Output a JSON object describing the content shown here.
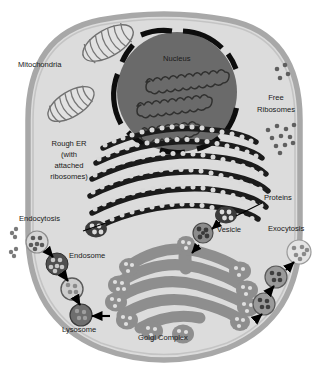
{
  "diagram": {
    "type": "biology-cell-diagram",
    "background_color": "#ffffff",
    "colors": {
      "cell_membrane": "#a8a8a8",
      "cytoplasm": "#dcdcdc",
      "nucleus_fill": "#6a6a6a",
      "nuclear_envelope": "#101010",
      "chromatin": "#3a3a3a",
      "rough_er_membrane": "#1c1c1c",
      "ribosome_dot": "#d8d8d8",
      "golgi_fill": "#8e8e8e",
      "mitochondria_fill": "#e0e0e0",
      "mitochondria_outline": "#6f6f6f",
      "vesicle_fill": "#9a9a9a",
      "lysosome_fill": "#707070",
      "endosome_fill": "#5a5a5a",
      "arrow_color": "#000000",
      "label_text": "#1a1a1a",
      "leader_line": "#000000"
    }
  },
  "labels": {
    "mitochondria": "Mitochondria",
    "nucleus": "Nucleus",
    "free_ribosomes_line1": "Free",
    "free_ribosomes_line2": "Ribosomes",
    "rough_er_line1": "Rough ER",
    "rough_er_line2": "(with",
    "rough_er_line3": "attached",
    "rough_er_line4": "ribosomes)",
    "proteins": "Proteins",
    "vesicle": "Vesicle",
    "exocytosis": "Exocytosis",
    "endocytosis": "Endocytosis",
    "endosome": "Endosome",
    "lysosome": "Lysosome",
    "golgi_complex": "Golgi Complex"
  },
  "structures": [
    {
      "name": "cell-membrane",
      "label": ""
    },
    {
      "name": "cytoplasm",
      "label": ""
    },
    {
      "name": "nucleus",
      "label": "Nucleus"
    },
    {
      "name": "mitochondrion-upper",
      "label": "Mitochondria"
    },
    {
      "name": "mitochondrion-lower",
      "label": "Mitochondria"
    },
    {
      "name": "rough-endoplasmic-reticulum",
      "label": "Rough ER (with attached ribosomes)"
    },
    {
      "name": "free-ribosomes",
      "label": "Free Ribosomes"
    },
    {
      "name": "golgi-complex",
      "label": "Golgi Complex"
    },
    {
      "name": "transport-vesicle",
      "label": "Vesicle"
    },
    {
      "name": "protein-cluster",
      "label": "Proteins"
    },
    {
      "name": "endosome",
      "label": "Endosome"
    },
    {
      "name": "lysosome",
      "label": "Lysosome"
    },
    {
      "name": "endocytosis-pathway",
      "label": "Endocytosis"
    },
    {
      "name": "exocytosis-pathway",
      "label": "Exocytosis"
    }
  ]
}
